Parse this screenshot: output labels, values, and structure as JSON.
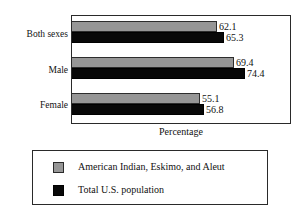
{
  "chart_data": {
    "type": "bar",
    "orientation": "horizontal",
    "title": "",
    "xlabel": "Percentage",
    "ylabel": "",
    "categories": [
      "Both sexes",
      "Male",
      "Female"
    ],
    "series": [
      {
        "name": "American Indian, Eskimo, and Aleut",
        "color": "#969696",
        "values": [
          62.1,
          69.4,
          55.1
        ]
      },
      {
        "name": "Total U.S. population",
        "color": "#080808",
        "values": [
          65.3,
          74.4,
          56.8
        ]
      }
    ],
    "value_labels": [
      [
        "62.1",
        "65.3"
      ],
      [
        "69.4",
        "74.4"
      ],
      [
        "55.1",
        "56.8"
      ]
    ],
    "xlim": [
      0,
      93.5
    ],
    "grid": false,
    "legend_position": "below"
  },
  "legend": {
    "items": [
      {
        "label": "American Indian, Eskimo, and Aleut",
        "swatch": "gray-swatch"
      },
      {
        "label": "Total U.S. population",
        "swatch": "black-swatch"
      }
    ]
  }
}
